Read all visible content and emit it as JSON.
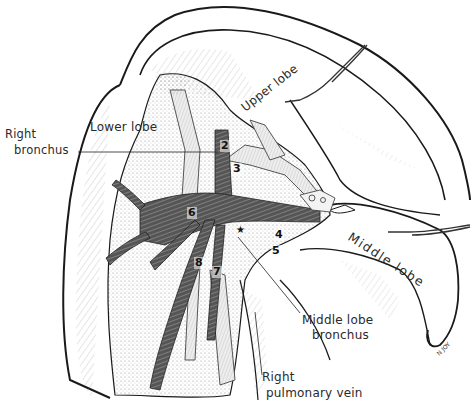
{
  "figure": {
    "labels": {
      "right_bronchus": [
        "Right",
        "bronchus"
      ],
      "lower_lobe": "Lower lobe",
      "upper_lobe": "Upper lobe",
      "middle_lobe": "Middle lobe",
      "middle_lobe_bronchus": [
        "Middle lobe",
        "bronchus"
      ],
      "right_pulmonary_vein": [
        "Right",
        "pulmonary vein"
      ]
    },
    "numbers": [
      "2",
      "3",
      "4",
      "5",
      "6",
      "7",
      "8"
    ],
    "star": "★",
    "signature": "N JOY"
  },
  "colors": {
    "outline": "#1a1a1a",
    "hatch": "#6a6a6a",
    "bronchus_dark": "#4a4a4a",
    "bronchus_stripe": "#8a8a8a",
    "stipple": "#9a9a9a",
    "background": "#ffffff"
  }
}
